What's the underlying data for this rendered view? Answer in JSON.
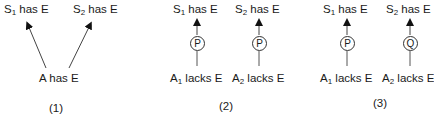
{
  "panels": [
    {
      "caption": "(1)",
      "top": [
        {
          "base": "S",
          "sub": "1",
          "rest": " has E"
        },
        {
          "base": "S",
          "sub": "2",
          "rest": " has E"
        }
      ],
      "bottom": [
        {
          "base": "A",
          "sub": "",
          "rest": " has E"
        }
      ],
      "nodes": []
    },
    {
      "caption": "(2)",
      "top": [
        {
          "base": "S",
          "sub": "1",
          "rest": " has E"
        },
        {
          "base": "S",
          "sub": "2",
          "rest": " has E"
        }
      ],
      "bottom": [
        {
          "base": "A",
          "sub": "1",
          "rest": " lacks E"
        },
        {
          "base": "A",
          "sub": "2",
          "rest": " lacks E"
        }
      ],
      "nodes": [
        "P",
        "P"
      ]
    },
    {
      "caption": "(3)",
      "top": [
        {
          "base": "S",
          "sub": "1",
          "rest": " has E"
        },
        {
          "base": "S",
          "sub": "2",
          "rest": " has E"
        }
      ],
      "bottom": [
        {
          "base": "A",
          "sub": "1",
          "rest": " lacks E"
        },
        {
          "base": "A",
          "sub": "2",
          "rest": " lacks E"
        }
      ],
      "nodes": [
        "P",
        "Q"
      ]
    }
  ]
}
